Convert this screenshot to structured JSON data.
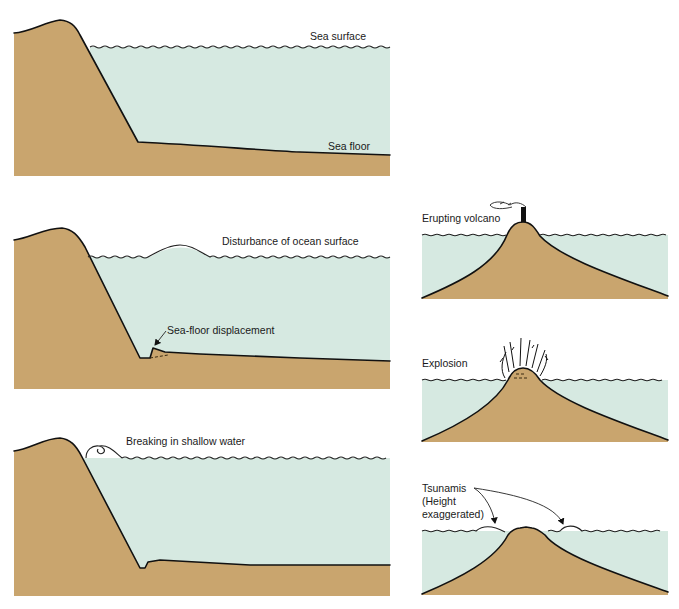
{
  "figure": {
    "colors": {
      "land": "#c9a56e",
      "water": "#d6e9e1",
      "outline": "#111111",
      "background": "#ffffff"
    }
  },
  "panels": [
    {
      "id": "continental-shelf-normal",
      "labels": {
        "sea_surface": "Sea surface",
        "sea_floor": "Sea floor"
      }
    },
    {
      "id": "continental-shelf-disturbance",
      "labels": {
        "disturbance": "Disturbance of ocean surface",
        "displacement": "Sea-floor displacement"
      }
    },
    {
      "id": "continental-shelf-breaking",
      "labels": {
        "breaking": "Breaking in shallow water"
      }
    },
    {
      "id": "volcano-erupting",
      "labels": {
        "erupting": "Erupting volcano"
      }
    },
    {
      "id": "volcano-explosion",
      "labels": {
        "explosion": "Explosion"
      }
    },
    {
      "id": "volcano-tsunamis",
      "labels": {
        "line1": "Tsunamis",
        "line2": "(Height",
        "line3": "exaggerated)"
      }
    }
  ]
}
